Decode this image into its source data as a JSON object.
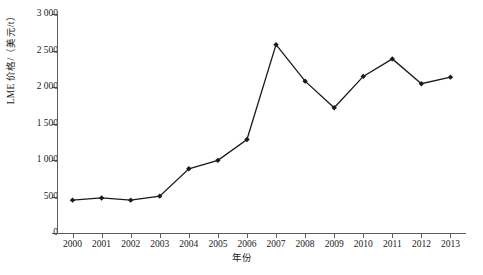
{
  "chart_data": {
    "type": "line",
    "title": "",
    "xlabel": "年份",
    "ylabel": "LME 价格/（美元/t）",
    "categories": [
      "2000",
      "2001",
      "2002",
      "2003",
      "2004",
      "2005",
      "2006",
      "2007",
      "2008",
      "2009",
      "2010",
      "2011",
      "2012",
      "2013"
    ],
    "x": [
      2000,
      2001,
      2002,
      2003,
      2004,
      2005,
      2006,
      2007,
      2008,
      2009,
      2010,
      2011,
      2012,
      2013
    ],
    "values": [
      450,
      480,
      450,
      505,
      880,
      995,
      1280,
      2580,
      2080,
      1715,
      2145,
      2385,
      2045,
      2135
    ],
    "series": [
      {
        "name": "LME 价格",
        "values": [
          450,
          480,
          450,
          505,
          880,
          995,
          1280,
          2580,
          2080,
          1715,
          2145,
          2385,
          2045,
          2135
        ]
      }
    ],
    "ylim": [
      0,
      3000
    ],
    "yticks": [
      0,
      500,
      1000,
      1500,
      2000,
      2500,
      3000
    ],
    "ytick_labels": [
      "0",
      "500",
      "1 000",
      "1 500",
      "2 000",
      "2 500",
      "3 000"
    ],
    "grid": false,
    "legend": "none",
    "marker": "diamond",
    "line_color": "#1a1a1a",
    "marker_color": "#1a1a1a",
    "axis_color": "#5b5b5b"
  }
}
